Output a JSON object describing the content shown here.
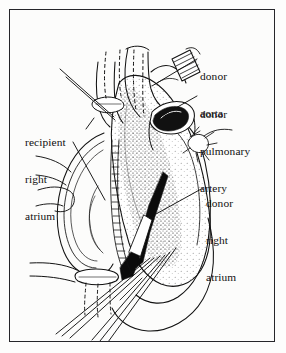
{
  "figure": {
    "domain_kind": "medical-illustration",
    "background_color": "#fcfcfb",
    "ink_color": "#111111",
    "border_color": "#26262a"
  },
  "labels": {
    "donor_aorta": {
      "lines": [
        "donor",
        "aorta"
      ],
      "line1": "donor",
      "line2": "aorta"
    },
    "donor_pulmonary_artery": {
      "lines": [
        "donor",
        "pulmonary",
        "artery"
      ],
      "line1": "donor",
      "line2": "pulmonary",
      "line3": "artery"
    },
    "donor_right_atrium": {
      "lines": [
        "donor",
        "right",
        "atrium"
      ],
      "line1": "donor",
      "line2": "right",
      "line3": "atrium"
    },
    "recipient_right_atrium": {
      "lines": [
        "recipient",
        "right",
        "atrium"
      ],
      "line1": "recipient",
      "line2": "right",
      "line3": "atrium"
    }
  },
  "anatomy_parts": [
    "donor-aorta-stump",
    "donor-pulmonary-artery-stump",
    "donor-right-atrium",
    "recipient-right-atrium-cuff",
    "superior-vena-cava",
    "inferior-vena-cava",
    "atrial-suture-line",
    "ventricular-apex",
    "suture-threads"
  ]
}
